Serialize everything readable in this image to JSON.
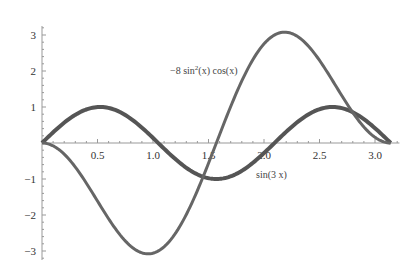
{
  "chart_data": {
    "type": "line",
    "title": "",
    "xlabel": "",
    "ylabel": "",
    "xlim": [
      0,
      3.14159
    ],
    "ylim": [
      -3.2,
      3.2
    ],
    "grid": false,
    "x_ticks": [
      "0.5",
      "1.0",
      "1.5",
      "2.0",
      "2.5",
      "3.0"
    ],
    "y_ticks": [
      "-3",
      "-2",
      "-1",
      "1",
      "2",
      "3"
    ],
    "series": [
      {
        "name": "sin(3 x)",
        "label": "sin(3 x)",
        "stroke_width": 4,
        "color": "#555555",
        "x": [
          0,
          0.26,
          0.52,
          0.79,
          1.05,
          1.31,
          1.57,
          1.83,
          2.09,
          2.36,
          2.62,
          2.88,
          3.14
        ],
        "values": [
          0,
          0.71,
          1.0,
          0.71,
          0,
          -0.71,
          -1.0,
          -0.71,
          0,
          0.71,
          1.0,
          0.71,
          0
        ]
      },
      {
        "name": "-8 sin^2(x) cos(x)",
        "label": "−8 sin²(x) cos(x)",
        "stroke_width": 3,
        "color": "#666666",
        "x": [
          0,
          0.26,
          0.52,
          0.79,
          0.96,
          1.05,
          1.31,
          1.57,
          1.83,
          2.09,
          2.18,
          2.36,
          2.62,
          2.88,
          3.14
        ],
        "values": [
          0,
          -0.52,
          -1.73,
          -2.83,
          -3.08,
          -3.0,
          -1.73,
          0,
          1.73,
          3.0,
          3.08,
          2.83,
          1.73,
          0.52,
          0
        ]
      }
    ],
    "annotations": [
      {
        "text": "−8 sin²(x) cos(x)",
        "x": 1.58,
        "y": 1.95
      },
      {
        "text": "sin(3 x)",
        "x": 2.2,
        "y": -0.85
      }
    ]
  },
  "labels": {
    "curve1": "−8 sin",
    "curve1_sup": "2",
    "curve1_rest": "(x) cos(x)",
    "curve2": "sin(3 x)"
  }
}
